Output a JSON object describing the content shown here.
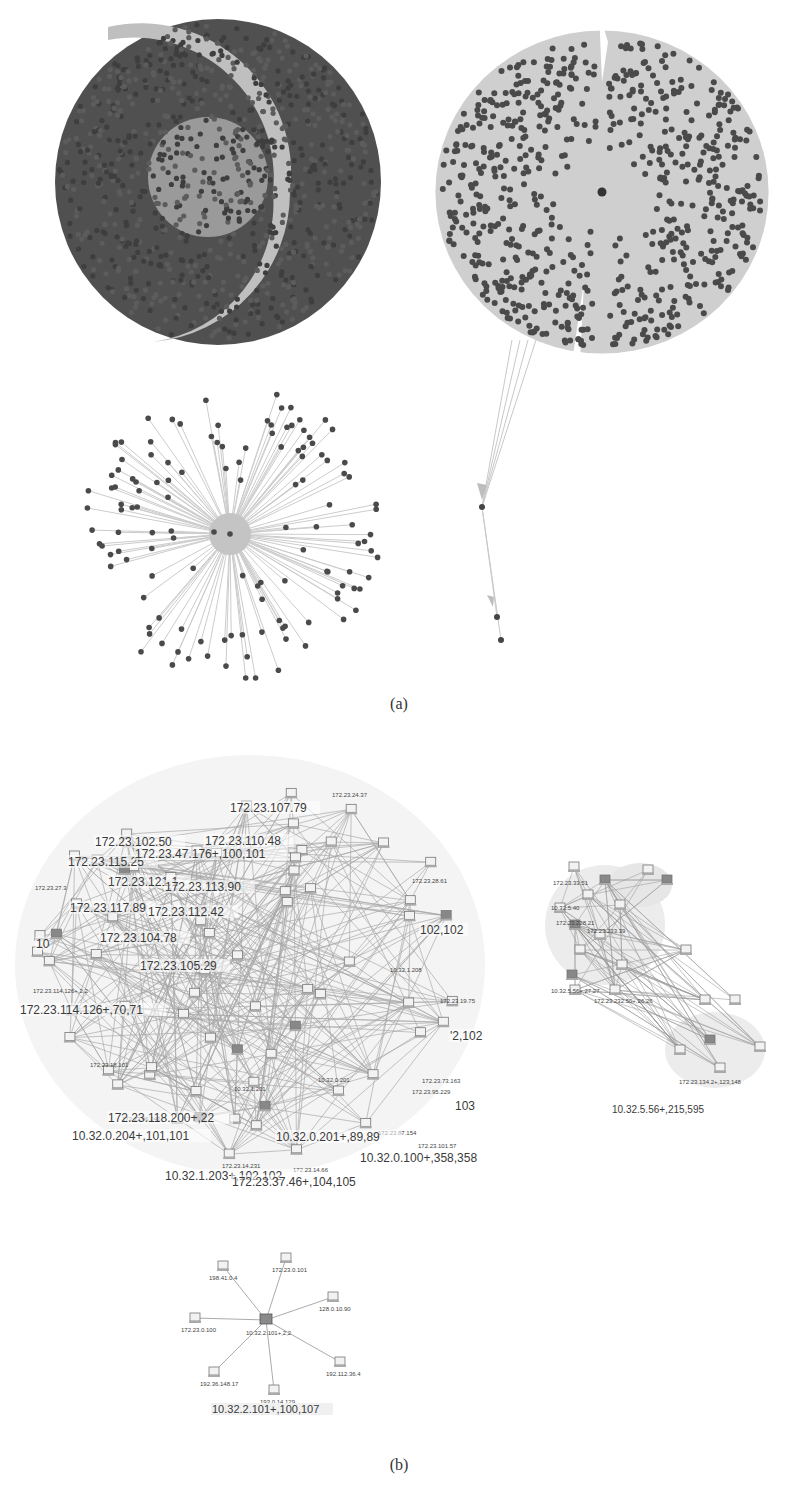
{
  "figure": {
    "caption_a": "(a)",
    "caption_b": "(b)"
  },
  "panel_a": {
    "graphs": [
      {
        "id": "dense-ring-graph",
        "type": "node-cloud",
        "cx": 218,
        "cy": 182,
        "r": 163,
        "node_color": "#4a4a4a",
        "edge_color": "#bdbdbd",
        "description": "very dense circular cluster with a light crescent gap"
      },
      {
        "id": "split-disc-graph",
        "type": "star-disc",
        "cx": 602,
        "cy": 192,
        "r": 170,
        "node_color": "#4a4a4a",
        "edge_color": "#c4c4c4",
        "tail_nodes": [
          [
            482,
            507
          ],
          [
            497,
            617
          ],
          [
            501,
            640
          ]
        ]
      },
      {
        "id": "sparse-star-graph",
        "type": "radial-star",
        "cx": 230,
        "cy": 534,
        "r": 150,
        "node_color": "#4a4a4a",
        "edge_color": "#c8c8c8"
      }
    ]
  },
  "panel_b": {
    "clusters": [
      {
        "id": "large-mesh-cluster",
        "labels_big": [
          {
            "text": "172.23.102.50",
            "x": 95,
            "y": 846
          },
          {
            "text": "172.23.115.25",
            "x": 68,
            "y": 866
          },
          {
            "text": "172.23.121.1",
            "x": 108,
            "y": 886
          },
          {
            "text": "172.23.113.90",
            "x": 165,
            "y": 891
          },
          {
            "text": "172.23.107.79",
            "x": 230,
            "y": 812
          },
          {
            "text": "172.23.110.48",
            "x": 205,
            "y": 845
          },
          {
            "text": "172.23.47.176+,100,101",
            "x": 135,
            "y": 858
          },
          {
            "text": "172.23.117.89",
            "x": 70,
            "y": 912
          },
          {
            "text": "172.23.112.42",
            "x": 148,
            "y": 916
          },
          {
            "text": "172.23.104.78",
            "x": 100,
            "y": 942
          },
          {
            "text": "172.23.105.29",
            "x": 140,
            "y": 970
          },
          {
            "text": "10",
            "x": 36,
            "y": 948
          },
          {
            "text": "172.23.114.126+,70,71",
            "x": 20,
            "y": 1014
          },
          {
            "text": "10.32.0.204+,101,101",
            "x": 72,
            "y": 1140
          },
          {
            "text": "10.32.1.203+,102,102",
            "x": 165,
            "y": 1180
          },
          {
            "text": "172.23.37.46+,104,105",
            "x": 232,
            "y": 1186
          },
          {
            "text": "10.32.0.201+,89,89",
            "x": 276,
            "y": 1141
          },
          {
            "text": "10.32.0.100+,358,358",
            "x": 360,
            "y": 1162
          },
          {
            "text": "102,102",
            "x": 420,
            "y": 934
          },
          {
            "text": "'2,102",
            "x": 450,
            "y": 1040
          },
          {
            "text": "103",
            "x": 455,
            "y": 1110
          },
          {
            "text": "172.23.118.200+,22",
            "x": 108,
            "y": 1122
          }
        ],
        "labels_small": [
          {
            "text": "172.23.27.3",
            "x": 35,
            "y": 890
          },
          {
            "text": "172.23.114.126+,2,2",
            "x": 33,
            "y": 993
          },
          {
            "text": "172.23.18.101",
            "x": 90,
            "y": 1067
          },
          {
            "text": "172.23.46.242",
            "x": 122,
            "y": 1121
          },
          {
            "text": "172.23.14.231",
            "x": 222,
            "y": 1168
          },
          {
            "text": "172.23.14.66",
            "x": 293,
            "y": 1172
          },
          {
            "text": "172.23.87.154",
            "x": 378,
            "y": 1135
          },
          {
            "text": "172.23.101.57",
            "x": 418,
            "y": 1148
          },
          {
            "text": "172.23.73.163",
            "x": 422,
            "y": 1083
          },
          {
            "text": "172.23.95.229",
            "x": 412,
            "y": 1094
          },
          {
            "text": "172.23.19.75",
            "x": 440,
            "y": 1003
          },
          {
            "text": "172.23.28.61",
            "x": 412,
            "y": 883
          },
          {
            "text": "172.23.24.37",
            "x": 332,
            "y": 797
          },
          {
            "text": "10.32.1.208",
            "x": 390,
            "y": 972
          },
          {
            "text": "10.32.1.201",
            "x": 234,
            "y": 1091
          },
          {
            "text": "10.32.0.201",
            "x": 318,
            "y": 1082
          }
        ]
      },
      {
        "id": "medium-chain-cluster",
        "labels_small": [
          {
            "text": "172.23.33.51",
            "x": 553,
            "y": 885
          },
          {
            "text": "10.32.5.40",
            "x": 551,
            "y": 910
          },
          {
            "text": "172.23.228.21",
            "x": 556,
            "y": 925
          },
          {
            "text": "172.23.233.39",
            "x": 587,
            "y": 933
          },
          {
            "text": "10.32.5.56+,27,27",
            "x": 551,
            "y": 993
          },
          {
            "text": "172.23.232.50+,26,26",
            "x": 594,
            "y": 1003
          },
          {
            "text": "172.23.134.2+,123,148",
            "x": 679,
            "y": 1084
          }
        ],
        "title": {
          "text": "10.32.5.56+,215,595",
          "x": 612,
          "y": 1113
        }
      },
      {
        "id": "small-star-cluster",
        "hub": {
          "x": 266,
          "y": 1320,
          "label": "10.32.2.101+,2,2"
        },
        "leaves": [
          {
            "x": 223,
            "y": 1266,
            "label": "198.41.0.4"
          },
          {
            "x": 286,
            "y": 1258,
            "label": "172.23.0.101"
          },
          {
            "x": 333,
            "y": 1297,
            "label": "128.0.10.90"
          },
          {
            "x": 195,
            "y": 1318,
            "label": "172.23.0.100"
          },
          {
            "x": 340,
            "y": 1362,
            "label": "192.112.36.4"
          },
          {
            "x": 214,
            "y": 1372,
            "label": "192.36.148.17"
          },
          {
            "x": 274,
            "y": 1390,
            "label": "193.0.14.129"
          }
        ],
        "title": {
          "text": "10.32.2.101+,100,107",
          "x": 212,
          "y": 1413
        }
      }
    ]
  }
}
